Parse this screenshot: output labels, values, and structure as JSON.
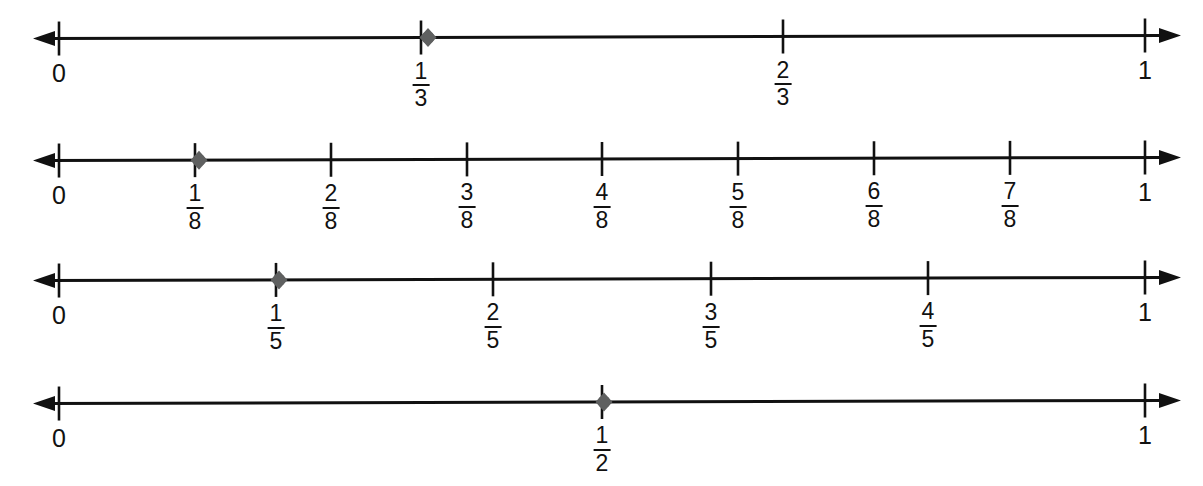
{
  "figure": {
    "colors": {
      "line": "#111111",
      "tick": "#111111",
      "point": "#5f6060",
      "background": "#ffffff",
      "text": "#111111"
    },
    "geometry": {
      "zero_x": 59,
      "one_x": 1145,
      "arrow_left_tip_x": 33,
      "arrow_right_tip_x": 1181
    }
  },
  "chart_data": {
    "type": "line",
    "xlabel": "",
    "ylabel": "",
    "xlim": [
      0,
      1
    ],
    "grid": false,
    "legend": null,
    "number_lines": [
      {
        "id": "thirds",
        "denominator": 3,
        "axis_y": 37,
        "start_label": "0",
        "end_label": "1",
        "ticks": [
          {
            "value": 0,
            "label_type": "whole",
            "numerator": null,
            "denominator": null,
            "text": "0",
            "x": 59
          },
          {
            "value": 0.3333,
            "label_type": "fraction",
            "numerator": "1",
            "denominator": "3",
            "text": "1/3",
            "x": 421
          },
          {
            "value": 0.6667,
            "label_type": "fraction",
            "numerator": "2",
            "denominator": "3",
            "text": "2/3",
            "x": 783
          },
          {
            "value": 1,
            "label_type": "whole",
            "numerator": null,
            "denominator": null,
            "text": "1",
            "x": 1145
          }
        ],
        "point": {
          "value": 0.3333,
          "text": "1/3",
          "x": 428
        }
      },
      {
        "id": "eighths",
        "denominator": 8,
        "axis_y": 159,
        "start_label": "0",
        "end_label": "1",
        "ticks": [
          {
            "value": 0,
            "label_type": "whole",
            "numerator": null,
            "denominator": null,
            "text": "0",
            "x": 59
          },
          {
            "value": 0.125,
            "label_type": "fraction",
            "numerator": "1",
            "denominator": "8",
            "text": "1/8",
            "x": 195
          },
          {
            "value": 0.25,
            "label_type": "fraction",
            "numerator": "2",
            "denominator": "8",
            "text": "2/8",
            "x": 331
          },
          {
            "value": 0.375,
            "label_type": "fraction",
            "numerator": "3",
            "denominator": "8",
            "text": "3/8",
            "x": 467
          },
          {
            "value": 0.5,
            "label_type": "fraction",
            "numerator": "4",
            "denominator": "8",
            "text": "4/8",
            "x": 602
          },
          {
            "value": 0.625,
            "label_type": "fraction",
            "numerator": "5",
            "denominator": "8",
            "text": "5/8",
            "x": 738
          },
          {
            "value": 0.75,
            "label_type": "fraction",
            "numerator": "6",
            "denominator": "8",
            "text": "6/8",
            "x": 874
          },
          {
            "value": 0.875,
            "label_type": "fraction",
            "numerator": "7",
            "denominator": "8",
            "text": "7/8",
            "x": 1010
          },
          {
            "value": 1,
            "label_type": "whole",
            "numerator": null,
            "denominator": null,
            "text": "1",
            "x": 1145
          }
        ],
        "point": {
          "value": 0.125,
          "text": "1/8",
          "x": 199
        }
      },
      {
        "id": "fifths",
        "denominator": 5,
        "axis_y": 279,
        "start_label": "0",
        "end_label": "1",
        "ticks": [
          {
            "value": 0,
            "label_type": "whole",
            "numerator": null,
            "denominator": null,
            "text": "0",
            "x": 59
          },
          {
            "value": 0.2,
            "label_type": "fraction",
            "numerator": "1",
            "denominator": "5",
            "text": "1/5",
            "x": 276
          },
          {
            "value": 0.4,
            "label_type": "fraction",
            "numerator": "2",
            "denominator": "5",
            "text": "2/5",
            "x": 493
          },
          {
            "value": 0.6,
            "label_type": "fraction",
            "numerator": "3",
            "denominator": "5",
            "text": "3/5",
            "x": 711
          },
          {
            "value": 0.8,
            "label_type": "fraction",
            "numerator": "4",
            "denominator": "5",
            "text": "4/5",
            "x": 928
          },
          {
            "value": 1,
            "label_type": "whole",
            "numerator": null,
            "denominator": null,
            "text": "1",
            "x": 1145
          }
        ],
        "point": {
          "value": 0.2,
          "text": "1/5",
          "x": 279
        }
      },
      {
        "id": "halves",
        "denominator": 2,
        "axis_y": 402,
        "start_label": "0",
        "end_label": "1",
        "ticks": [
          {
            "value": 0,
            "label_type": "whole",
            "numerator": null,
            "denominator": null,
            "text": "0",
            "x": 59
          },
          {
            "value": 0.5,
            "label_type": "fraction",
            "numerator": "1",
            "denominator": "2",
            "text": "1/2",
            "x": 602
          },
          {
            "value": 1,
            "label_type": "whole",
            "numerator": null,
            "denominator": null,
            "text": "1",
            "x": 1145
          }
        ],
        "point": {
          "value": 0.5,
          "text": "1/2",
          "x": 604
        }
      }
    ]
  }
}
